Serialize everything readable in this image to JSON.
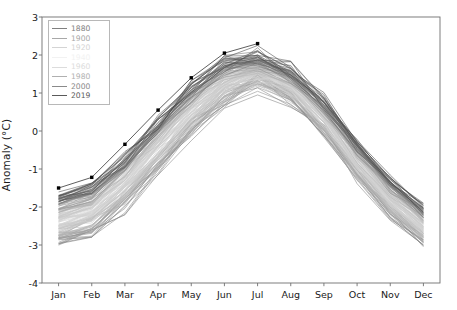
{
  "chart_data": {
    "type": "line",
    "title": "",
    "xlabel": "",
    "ylabel": "Anomaly (°C)",
    "categories": [
      "Jan",
      "Feb",
      "Mar",
      "Apr",
      "May",
      "Jun",
      "Jul",
      "Aug",
      "Sep",
      "Oct",
      "Nov",
      "Dec"
    ],
    "xtick_labels": [
      "Jan",
      "Feb",
      "Mar",
      "Apr",
      "May",
      "Jun",
      "Jul",
      "Aug",
      "Sep",
      "Oct",
      "Nov",
      "Dec"
    ],
    "ytick_labels": [
      "-4",
      "-3",
      "-2",
      "-1",
      "0",
      "1",
      "2",
      "3"
    ],
    "ytick_values": [
      -4,
      -3,
      -2,
      -1,
      0,
      1,
      2,
      3
    ],
    "ylim": [
      -4,
      3
    ],
    "xlim": [
      0.5,
      12.5
    ],
    "grid": false,
    "legend_position": "upper left",
    "legend_title": "",
    "legend_entries": [
      {
        "label": "1880",
        "color": "#808080"
      },
      {
        "label": "1900",
        "color": "#a8a8a8"
      },
      {
        "label": "1920",
        "color": "#d4d4d4"
      },
      {
        "label": "1940",
        "color": "#f2f2f2"
      },
      {
        "label": "1960",
        "color": "#dcdcdc"
      },
      {
        "label": "1980",
        "color": "#b0b0b0"
      },
      {
        "label": "2000",
        "color": "#8a8a8a"
      },
      {
        "label": "2019",
        "color": "#5a5a5a"
      }
    ],
    "series": [
      {
        "name": "2019",
        "marker": "point",
        "marker_color": "#000000",
        "line_color": "#4d4d4d",
        "values": [
          -1.5,
          -1.22,
          -0.35,
          0.55,
          1.4,
          2.05,
          2.3,
          null,
          null,
          null,
          null,
          null
        ]
      },
      {
        "name": "band_upper_envelope",
        "values": [
          -1.3,
          -1.05,
          -0.25,
          0.7,
          1.55,
          2.15,
          2.25,
          1.9,
          1.05,
          -0.05,
          -1.0,
          -1.7
        ]
      },
      {
        "name": "band_lower_envelope",
        "values": [
          -3.4,
          -3.15,
          -2.45,
          -1.45,
          -0.45,
          0.45,
          0.95,
          0.55,
          -0.35,
          -1.55,
          -2.55,
          -3.3
        ]
      },
      {
        "name": "band_center_mean",
        "values": [
          -2.35,
          -2.1,
          -1.35,
          -0.4,
          0.55,
          1.3,
          1.6,
          1.25,
          0.35,
          -0.8,
          -1.75,
          -2.5
        ]
      }
    ],
    "n_lines": 140,
    "line_palette_note": "greys-colormap cycling dark-to-light-to-dark by year 1880-2019"
  },
  "axes": {
    "ylabel": "Anomaly (°C)"
  }
}
